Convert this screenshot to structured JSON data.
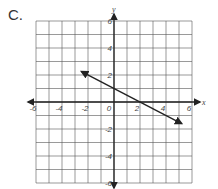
{
  "problem_label": "C.",
  "chart_data": {
    "type": "line",
    "title": "",
    "xlabel": "x",
    "ylabel": "y",
    "xlim": [
      -6,
      6
    ],
    "ylim": [
      -6,
      6
    ],
    "grid": true,
    "grid_step": 1,
    "x_tick_labels": [
      "-6",
      "-4",
      "-2",
      "0",
      "2",
      "4",
      "6"
    ],
    "y_tick_labels": [
      "6",
      "4",
      "2",
      "-2",
      "-4",
      "-6"
    ],
    "series": [
      {
        "name": "line",
        "equation": "y = -0.5x + 1",
        "slope": -0.5,
        "y_intercept": 1,
        "x_intercept": 2,
        "points": [
          [
            -2.5,
            2.25
          ],
          [
            0,
            1
          ],
          [
            2,
            0
          ],
          [
            5.2,
            -1.6
          ]
        ],
        "arrows": "both ends"
      }
    ]
  },
  "colors": {
    "grid": "#555555",
    "axis": "#222222",
    "line": "#222222"
  }
}
